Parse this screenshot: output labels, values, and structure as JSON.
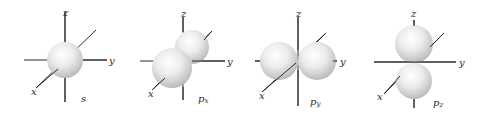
{
  "figure": {
    "axis_labels": {
      "x": "x",
      "y": "y",
      "z": "z"
    },
    "orbitals": [
      {
        "id": "s",
        "label_main": "s",
        "label_sub": ""
      },
      {
        "id": "px",
        "label_main": "p",
        "label_sub": "x"
      },
      {
        "id": "py",
        "label_main": "p",
        "label_sub": "y"
      },
      {
        "id": "pz",
        "label_main": "p",
        "label_sub": "z"
      }
    ],
    "colors": {
      "axis": "#2a2a2a",
      "sphere_light": "#ffffff",
      "sphere_dark": "#b4b4b4",
      "background": "#ffffff"
    }
  }
}
